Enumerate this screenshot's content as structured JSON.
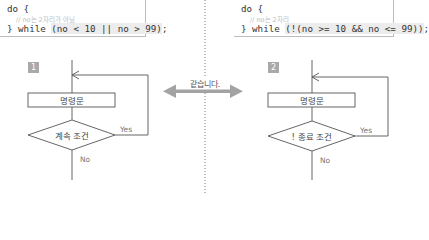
{
  "left_panel": {
    "code": {
      "line1": "do {",
      "comment": "// no는 2자리가 아님",
      "line3_prefix": "} while ",
      "line3_cond": "(no < 10 || no > 99)",
      "line3_suffix": ";"
    },
    "badge": "1",
    "flowchart": {
      "statement": "명령문",
      "condition": "계속 조건",
      "yes_label": "Yes",
      "no_label": "No"
    }
  },
  "right_panel": {
    "code": {
      "line1": "do {",
      "comment": "// no는 2자리",
      "line3_prefix": "} while ",
      "line3_cond": "(!(no >= 10 && no <= 99))",
      "line3_suffix": ";"
    },
    "badge": "2",
    "flowchart": {
      "statement": "명령문",
      "condition": "! 종료 조건",
      "yes_label": "Yes",
      "no_label": "No"
    }
  },
  "middle": {
    "equivalence_label": "같습니다."
  },
  "colors": {
    "line": "#555555",
    "arrow": "#a0a0a0",
    "badge": "#a9a9a9",
    "box_shadow": "#bdbdbd"
  }
}
